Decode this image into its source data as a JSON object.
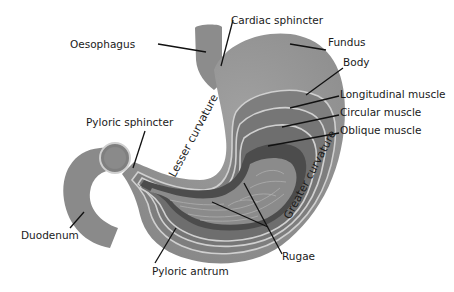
{
  "diagram": {
    "labels": {
      "oesophagus": "Oesophagus",
      "cardiac_sphincter": "Cardiac sphincter",
      "fundus": "Fundus",
      "body": "Body",
      "longitudinal_muscle": "Longitudinal muscle",
      "circular_muscle": "Circular muscle",
      "oblique_muscle": "Oblique muscle",
      "pyloric_sphincter": "Pyloric sphincter",
      "lesser_curvature": "Lesser curvature",
      "greater_curvature": "Greater curvature",
      "duodenum": "Duodenum",
      "pyloric_antrum": "Pyloric antrum",
      "rugae": "Rugae"
    },
    "colors": {
      "outer_wall": "#8f8f8f",
      "longitudinal_layer": "#7d7d7d",
      "circular_layer": "#737373",
      "oblique_layer": "#6b6b6b",
      "mucosa_dark": "#4a4a4a",
      "interior": "#8a8a8a",
      "layer_edge": "#cfcfcf",
      "leader_line": "#111111"
    }
  }
}
